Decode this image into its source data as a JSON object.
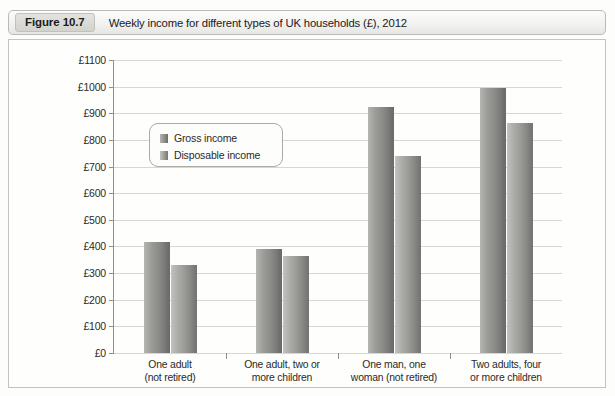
{
  "figure": {
    "tag": "Figure 10.7",
    "caption": "Weekly income for different types of UK households (£), 2012"
  },
  "chart_data": {
    "type": "bar",
    "title": "Weekly income for different types of UK households (£), 2012",
    "xlabel": "",
    "ylabel": "",
    "ylim": [
      0,
      1100
    ],
    "ytick_step": 100,
    "grid": true,
    "legend_position": "top-left-inside",
    "categories": [
      "One adult (not retired)",
      "One adult, two or more children",
      "One man, one woman (not retired)",
      "Two adults, four or more children"
    ],
    "category_lines": [
      [
        "One adult",
        "(not retired)"
      ],
      [
        "One adult, two or",
        "more children"
      ],
      [
        "One man, one",
        "woman (not retired)"
      ],
      [
        "Two adults, four",
        "or more children"
      ]
    ],
    "ytick_labels": [
      "£0",
      "£100",
      "£200",
      "£300",
      "£400",
      "£500",
      "£600",
      "£700",
      "£800",
      "£900",
      "£1000",
      "£1100"
    ],
    "series": [
      {
        "name": "Gross income",
        "values": [
          415,
          390,
          925,
          995
        ],
        "color": "#8e8e8b"
      },
      {
        "name": "Disposable income",
        "values": [
          330,
          365,
          740,
          865
        ],
        "color": "#a8a8a5"
      }
    ]
  }
}
